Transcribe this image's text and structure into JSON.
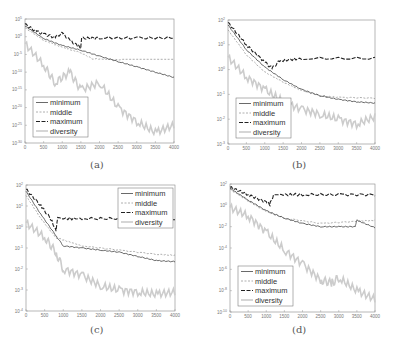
{
  "figure": {
    "captions": [
      "(a)",
      "(b)",
      "(c)",
      "(d)"
    ]
  },
  "chart_data": [
    {
      "panel": "(a)",
      "type": "line",
      "title": "",
      "xlabel": "",
      "ylabel": "",
      "yscale": "log",
      "x_ticks": [
        "0",
        "500",
        "1000",
        "1500",
        "2000",
        "2500",
        "3000",
        "3500",
        "4000"
      ],
      "xlim": [
        0,
        4000
      ],
      "y_ticks": [
        "10^5",
        "10^0",
        "10^-5",
        "10^-10",
        "10^-15",
        "10^-20",
        "10^-25",
        "10^-30"
      ],
      "ylim_exp": [
        -30,
        5
      ],
      "legend": [
        "minimum",
        "middle",
        "maximum",
        "diversity"
      ],
      "legend_position": "lower left",
      "box": [
        25,
        19,
        174,
        143
      ],
      "series": [
        {
          "name": "maximum",
          "color": "#222222",
          "points": [
            [
              0,
              3.5
            ],
            [
              300,
              1.5
            ],
            [
              500,
              0.8
            ],
            [
              800,
              -0.2
            ],
            [
              1000,
              1
            ],
            [
              1200,
              -1
            ],
            [
              1400,
              -2.5
            ],
            [
              1500,
              -3
            ],
            [
              1520,
              -0.5
            ],
            [
              2000,
              -0.3
            ],
            [
              3000,
              -0.4
            ],
            [
              4000,
              -0.3
            ]
          ]
        },
        {
          "name": "minimum",
          "color": "#444444",
          "points": [
            [
              0,
              3
            ],
            [
              500,
              -0.5
            ],
            [
              1000,
              -2.5
            ],
            [
              1500,
              -3.8
            ],
            [
              2000,
              -5.5
            ],
            [
              2500,
              -7
            ],
            [
              3000,
              -8.5
            ],
            [
              3500,
              -10
            ],
            [
              4000,
              -11.5
            ]
          ]
        },
        {
          "name": "middle",
          "color": "#999999",
          "points": [
            [
              0,
              2.5
            ],
            [
              500,
              -1
            ],
            [
              1000,
              -3
            ],
            [
              1500,
              -4.5
            ],
            [
              1800,
              -6.2
            ],
            [
              2500,
              -6.5
            ],
            [
              4000,
              -6.5
            ]
          ]
        },
        {
          "name": "diversity",
          "color": "#cccccc",
          "points": [
            [
              0,
              -2
            ],
            [
              500,
              -8
            ],
            [
              800,
              -13
            ],
            [
              1200,
              -10
            ],
            [
              1500,
              -15
            ],
            [
              2000,
              -13
            ],
            [
              2500,
              -20
            ],
            [
              3000,
              -24
            ],
            [
              3500,
              -27
            ],
            [
              4000,
              -25
            ]
          ]
        }
      ]
    },
    {
      "panel": "(b)",
      "type": "line",
      "yscale": "log",
      "x_ticks": [
        "0",
        "500",
        "1000",
        "1500",
        "2000",
        "2500",
        "3000",
        "3500",
        "4000"
      ],
      "xlim": [
        0,
        4000
      ],
      "y_ticks": [
        "10^2",
        "10^1",
        "10^0",
        "10^-1",
        "10^-2",
        "10^-3"
      ],
      "ylim_exp": [
        -3,
        2
      ],
      "legend": [
        "minimum",
        "middle",
        "maximum",
        "diversity"
      ],
      "legend_position": "lower left",
      "box": [
        228,
        20,
        375,
        144
      ],
      "series": [
        {
          "name": "maximum",
          "color": "#222222",
          "points": [
            [
              0,
              1.9
            ],
            [
              500,
              1
            ],
            [
              1000,
              0.3
            ],
            [
              1200,
              0.05
            ],
            [
              1400,
              0.35
            ],
            [
              2000,
              0.45
            ],
            [
              4000,
              0.45
            ]
          ]
        },
        {
          "name": "minimum",
          "color": "#444444",
          "points": [
            [
              0,
              1.8
            ],
            [
              500,
              0.8
            ],
            [
              1000,
              0.1
            ],
            [
              1500,
              -0.4
            ],
            [
              2000,
              -0.8
            ],
            [
              2500,
              -1.05
            ],
            [
              3000,
              -1.2
            ],
            [
              3500,
              -1.3
            ],
            [
              4000,
              -1.35
            ]
          ]
        },
        {
          "name": "middle",
          "color": "#999999",
          "points": [
            [
              0,
              1.6
            ],
            [
              500,
              0.6
            ],
            [
              1000,
              -0.1
            ],
            [
              1500,
              -0.5
            ],
            [
              2000,
              -0.85
            ],
            [
              2500,
              -1.05
            ],
            [
              3000,
              -1.12
            ],
            [
              4000,
              -1.15
            ]
          ]
        },
        {
          "name": "diversity",
          "color": "#cccccc",
          "points": [
            [
              0,
              0.5
            ],
            [
              500,
              -0.3
            ],
            [
              1000,
              -0.8
            ],
            [
              1500,
              -1.3
            ],
            [
              2000,
              -1.6
            ],
            [
              2500,
              -1.8
            ],
            [
              3000,
              -2
            ],
            [
              3500,
              -2.2
            ],
            [
              4000,
              -1.9
            ]
          ]
        }
      ]
    },
    {
      "panel": "(c)",
      "type": "line",
      "yscale": "log",
      "x_ticks": [
        "0",
        "500",
        "1000",
        "1500",
        "2000",
        "2500",
        "3000",
        "3500",
        "4000"
      ],
      "xlim": [
        0,
        4000
      ],
      "y_ticks": [
        "10^2",
        "10^1",
        "10^0",
        "10^-1",
        "10^-2",
        "10^-3",
        "10^-4"
      ],
      "ylim_exp": [
        -4,
        2
      ],
      "legend": [
        "minimum",
        "middle",
        "maximum",
        "diversity"
      ],
      "legend_position": "upper right",
      "box": [
        26,
        185,
        175,
        311
      ],
      "series": [
        {
          "name": "maximum",
          "color": "#222222",
          "points": [
            [
              0,
              1.8
            ],
            [
              400,
              1
            ],
            [
              700,
              0.3
            ],
            [
              800,
              -0.2
            ],
            [
              850,
              0.4
            ],
            [
              1500,
              0.4
            ],
            [
              2500,
              0.4
            ],
            [
              4000,
              0.4
            ]
          ]
        },
        {
          "name": "minimum",
          "color": "#444444",
          "points": [
            [
              0,
              1.7
            ],
            [
              400,
              0.6
            ],
            [
              800,
              -0.4
            ],
            [
              1000,
              -0.9
            ],
            [
              1500,
              -1
            ],
            [
              2000,
              -1.1
            ],
            [
              2500,
              -1.2
            ],
            [
              3000,
              -1.4
            ],
            [
              3500,
              -1.6
            ],
            [
              4000,
              -1.65
            ]
          ]
        },
        {
          "name": "middle",
          "color": "#999999",
          "points": [
            [
              0,
              1.5
            ],
            [
              400,
              0.4
            ],
            [
              800,
              -0.5
            ],
            [
              1500,
              -0.9
            ],
            [
              2500,
              -1.1
            ],
            [
              3500,
              -1.3
            ],
            [
              4000,
              -1.35
            ]
          ]
        },
        {
          "name": "diversity",
          "color": "#cccccc",
          "points": [
            [
              0,
              0.2
            ],
            [
              500,
              -0.5
            ],
            [
              800,
              -1.2
            ],
            [
              1000,
              -2
            ],
            [
              1500,
              -2.3
            ],
            [
              2000,
              -2.8
            ],
            [
              2500,
              -3
            ],
            [
              3000,
              -3.1
            ],
            [
              3500,
              -3.2
            ],
            [
              4000,
              -3.1
            ]
          ]
        }
      ]
    },
    {
      "panel": "(d)",
      "type": "line",
      "yscale": "log",
      "x_ticks": [
        "0",
        "500",
        "1000",
        "1500",
        "2000",
        "2500",
        "3000",
        "3500",
        "4000"
      ],
      "xlim": [
        0,
        4000
      ],
      "y_ticks": [
        "10^2",
        "10^0",
        "10^-2",
        "10^-4",
        "10^-6",
        "10^-8",
        "10^-10"
      ],
      "ylim_exp": [
        -10,
        2
      ],
      "legend": [
        "minimum",
        "middle",
        "maximum",
        "diversity"
      ],
      "legend_position": "lower left",
      "box": [
        230,
        184,
        375,
        312
      ],
      "series": [
        {
          "name": "maximum",
          "color": "#222222",
          "points": [
            [
              0,
              1.7
            ],
            [
              500,
              1
            ],
            [
              1000,
              0.3
            ],
            [
              1100,
              0.1
            ],
            [
              1200,
              1
            ],
            [
              2000,
              1
            ],
            [
              3000,
              1
            ],
            [
              4000,
              1
            ]
          ]
        },
        {
          "name": "minimum",
          "color": "#444444",
          "points": [
            [
              0,
              1.6
            ],
            [
              500,
              0.5
            ],
            [
              1000,
              -0.5
            ],
            [
              1500,
              -1.2
            ],
            [
              2000,
              -1.7
            ],
            [
              2500,
              -2
            ],
            [
              3000,
              -2
            ],
            [
              3450,
              -2
            ],
            [
              3500,
              -1.4
            ],
            [
              4000,
              -2.1
            ]
          ]
        },
        {
          "name": "middle",
          "color": "#999999",
          "points": [
            [
              0,
              1.5
            ],
            [
              500,
              0.4
            ],
            [
              1000,
              -0.6
            ],
            [
              1500,
              -1.2
            ],
            [
              2500,
              -1.7
            ],
            [
              3500,
              -1.5
            ],
            [
              4000,
              -1.4
            ]
          ]
        },
        {
          "name": "diversity",
          "color": "#cccccc",
          "points": [
            [
              0,
              -0.2
            ],
            [
              500,
              -1
            ],
            [
              1000,
              -2.5
            ],
            [
              1500,
              -4.2
            ],
            [
              2000,
              -5.5
            ],
            [
              2500,
              -7
            ],
            [
              2800,
              -7.3
            ],
            [
              3000,
              -6.8
            ],
            [
              3500,
              -8
            ],
            [
              4000,
              -8.8
            ]
          ]
        }
      ]
    }
  ]
}
